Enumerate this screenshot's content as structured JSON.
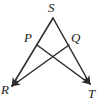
{
  "figure": {
    "kind": "geometry-diagram",
    "background_color": "#ffffff",
    "stroke_color": "#2b2b2b",
    "label_color": "#1a1a1a",
    "stroke_width": 1.5,
    "points": {
      "S": {
        "label": "S",
        "x": 53,
        "y": 17,
        "label_x": 48,
        "label_y": 1
      },
      "P": {
        "label": "P",
        "x": 37,
        "y": 44,
        "label_x": 24,
        "label_y": 31
      },
      "Q": {
        "label": "Q",
        "x": 69,
        "y": 44,
        "label_x": 71,
        "label_y": 31
      },
      "R": {
        "label": "R",
        "x": 10,
        "y": 88,
        "label_x": 1,
        "label_y": 83
      },
      "T": {
        "label": "T",
        "x": 92,
        "y": 86,
        "label_x": 88,
        "label_y": 87
      }
    },
    "segments": [
      {
        "name": "segment-S-R",
        "from": "S",
        "to": "R",
        "arrow_end": true
      },
      {
        "name": "segment-S-T",
        "from": "S",
        "to": "T",
        "arrow_end": true
      },
      {
        "name": "segment-P-T",
        "from": "P",
        "to": "T",
        "arrow_end": true
      },
      {
        "name": "segment-Q-R",
        "from": "Q",
        "to": "R",
        "arrow_end": true
      }
    ],
    "intersection": {
      "name": "cevian-crossing",
      "x": 53,
      "y": 58
    }
  }
}
